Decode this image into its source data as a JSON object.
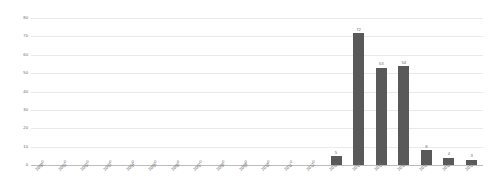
{
  "chart_data": {
    "type": "bar",
    "title": "",
    "xlabel": "",
    "ylabel": "",
    "ylim": [
      0,
      80
    ],
    "yticks": [
      0,
      10,
      20,
      30,
      40,
      50,
      60,
      70,
      80
    ],
    "grid": true,
    "legend": false,
    "bar_color": "#595959",
    "gridline_color": "#e9e9e9",
    "axis_color": "#bdbdbd",
    "label_color": "#6b6b6b",
    "categories": [
      "2000",
      "2001",
      "2002",
      "2003",
      "2004",
      "2005",
      "2006",
      "2007",
      "2008",
      "2009",
      "2010",
      "2011",
      "2012",
      "2013",
      "2014",
      "2015",
      "2016",
      "2017",
      "2018",
      "2019"
    ],
    "values": [
      0,
      0,
      0,
      0,
      0,
      0,
      0,
      0,
      0,
      0,
      0,
      0,
      0,
      5,
      72,
      53,
      54,
      8,
      4,
      3
    ],
    "data_labels": [
      "0",
      "0",
      "0",
      "0",
      "0",
      "0",
      "0",
      "0",
      "0",
      "0",
      "0",
      "0",
      "0",
      "5",
      "72",
      "53",
      "54",
      "8",
      "4",
      "3"
    ]
  }
}
